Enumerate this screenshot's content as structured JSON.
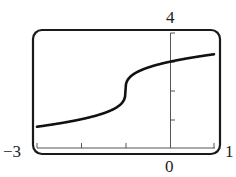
{
  "chart_data": {
    "type": "line",
    "title": "",
    "xlabel": "",
    "ylabel": "",
    "xlim": [
      -3,
      1
    ],
    "ylim": [
      0,
      4
    ],
    "grid": false,
    "legend": null,
    "x_tick_step": 1,
    "y_tick_step": 1,
    "axis_labels": {
      "x_min": "−3",
      "x_max": "1",
      "x_origin": "0",
      "y_max": "4"
    },
    "series": [
      {
        "name": "curve",
        "description": "Cube-root shaped curve with vertical inflection near x = -1, y = 2",
        "x": [
          -3,
          -2.5,
          -2,
          -1.5,
          -1.2,
          -1.05,
          -1,
          -0.95,
          -0.8,
          -0.5,
          0,
          0.5,
          1
        ],
        "y": [
          0.74,
          0.86,
          1.0,
          1.21,
          1.42,
          1.63,
          2.0,
          2.37,
          2.58,
          2.79,
          3.0,
          3.14,
          3.26
        ]
      }
    ],
    "frame": "rounded calculator-screen border"
  },
  "labels": {
    "x_min": "−3",
    "x_max": "1",
    "x_origin": "0",
    "y_max": "4"
  },
  "colors": {
    "curve": "#111111",
    "axis": "#555555",
    "frame": "#1a1a1a"
  }
}
